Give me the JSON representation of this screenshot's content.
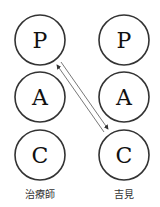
{
  "diagram": {
    "type": "transactional-analysis-PAC",
    "columns": [
      {
        "label": "治療師",
        "states": [
          "P",
          "A",
          "C"
        ]
      },
      {
        "label": "吉見",
        "states": [
          "P",
          "A",
          "C"
        ]
      }
    ],
    "transactions": [
      {
        "from": "right.C",
        "to": "left.P",
        "direction": "up"
      },
      {
        "from": "left.P",
        "to": "right.C",
        "direction": "down"
      }
    ],
    "colors": {
      "stroke": "#333333",
      "arrow": "#555555",
      "text": "#111111"
    }
  }
}
